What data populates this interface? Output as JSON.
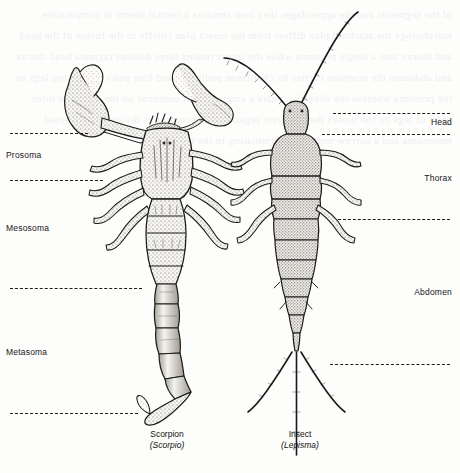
{
  "figure": {
    "type": "scientific-illustration",
    "background_color": "#fdfdfc",
    "ink_color": "#1d1d1d"
  },
  "labels_left": [
    {
      "name": "prosoma",
      "text": "Prosoma",
      "x": 6,
      "y": 150
    },
    {
      "name": "mesosoma",
      "text": "Mesosoma",
      "x": 6,
      "y": 223
    },
    {
      "name": "metasoma",
      "text": "Metasoma",
      "x": 6,
      "y": 347
    }
  ],
  "labels_right": [
    {
      "name": "head",
      "text": "Head",
      "y": 117
    },
    {
      "name": "thorax",
      "text": "Thorax",
      "y": 173
    },
    {
      "name": "abdomen",
      "text": "Abdomen",
      "y": 287
    }
  ],
  "leader_lines": {
    "left": [
      {
        "name": "prosoma-top",
        "x": 10,
        "y": 133,
        "width": 78
      },
      {
        "name": "prosoma-bottom",
        "x": 10,
        "y": 180,
        "width": 93
      },
      {
        "name": "mesosoma-bottom",
        "x": 10,
        "y": 288,
        "width": 132
      },
      {
        "name": "metasoma-bottom",
        "x": 10,
        "y": 413,
        "width": 128
      }
    ],
    "right": [
      {
        "name": "head-top",
        "x": 333,
        "y": 113,
        "width": 117
      },
      {
        "name": "head-bottom",
        "x": 322,
        "y": 134,
        "width": 128
      },
      {
        "name": "thorax-bottom",
        "x": 338,
        "y": 219,
        "width": 112
      },
      {
        "name": "abdomen-bottom",
        "x": 330,
        "y": 364,
        "width": 120
      }
    ]
  },
  "captions": [
    {
      "name": "scorpion",
      "common": "Scorpion",
      "scientific": "(Scorpio)",
      "center_x": 167,
      "y": 434
    },
    {
      "name": "insect",
      "common": "Insect",
      "scientific": "(Lepisma)",
      "center_x": 300,
      "y": 434
    }
  ],
  "showthrough_text": "of the segments and the appendages they bear remains a central theme in comparative morphology the arachnid plan differs from the insect plan chiefly in the fusion of the head and thorax into a single prosoma while the insect retains three distinct tagmata head thorax and abdomen the scorpion carries its chelicerae pedipalps and four pairs of walking legs on the prosoma whereas the silverfish bears a single pair of antennae on the head and three pairs of legs on the thorax the posterior region of the scorpion is divided into a broad mesosoma and a narrow metasoma terminating in the telson"
}
